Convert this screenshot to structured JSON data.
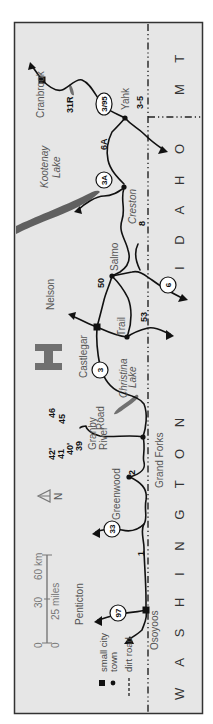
{
  "page": {
    "header_text": ""
  },
  "map": {
    "frame": {
      "background": "#e6e6e6",
      "border": "#333333"
    },
    "colors": {
      "road": "#111111",
      "water": "#606060",
      "label": "#555555",
      "logo": "#707070"
    },
    "states": {
      "montana": "M T",
      "idaho": "I D A H O",
      "washington": "W A S H I N G T O N"
    },
    "places": {
      "cranbrook": "Cranbrook",
      "yahk": "Yahk",
      "creston": "Creston",
      "kootenay_lake": "Kootenay Lake",
      "kootenay_line1": "Kootenay",
      "kootenay_line2": "Lake",
      "salmo": "Salmo",
      "nelson": "Nelson",
      "castlegar": "Castlegar",
      "trail": "Trail",
      "christina_line1": "Christina",
      "christina_line2": "Lake",
      "granby_line1": "Granby",
      "granby_line2": "River",
      "granby_line3": "Road",
      "grand_forks": "Grand Forks",
      "greenwood": "Greenwood",
      "penticton": "Penticton",
      "osoyoos": "Osoyoos"
    },
    "route_numbers": {
      "r31R": "31R",
      "r3_5": "3-5",
      "r6A": "6A",
      "r8": "8",
      "r50": "50",
      "r53": "53",
      "r46": "46",
      "r45": "45",
      "r42": "42'",
      "r41": "41",
      "r40": "40'",
      "r39": "39",
      "r2": "2",
      "r1": "1"
    },
    "highway_shields": {
      "h3_95": "3/95",
      "h3A": "3A",
      "h6": "6",
      "h3": "3",
      "h33": "33",
      "h97": "97"
    },
    "compass": {
      "label": "N"
    },
    "scale": {
      "km_zero": "0",
      "km_mid": "30",
      "km_end": "60 km",
      "mi_zero": "0",
      "mi_end": "25 miles"
    },
    "legend": {
      "small_city": "small city",
      "town": "town",
      "dirt_road": "dirt road"
    }
  }
}
